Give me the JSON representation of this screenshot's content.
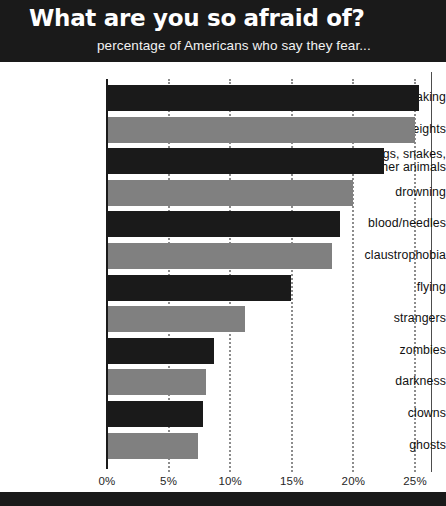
{
  "header": {
    "title": "What are you so afraid of?",
    "subtitle": "percentage of Americans who say they fear..."
  },
  "colors": {
    "band_background": "#1a1a1a",
    "bar_dark": "#1a1a1a",
    "bar_light": "#808080",
    "gridline": "#8c8c8c",
    "page_background": "#ffffff"
  },
  "chart_data": {
    "type": "bar",
    "orientation": "horizontal",
    "title": "What are you so afraid of?",
    "subtitle": "percentage of Americans who say they fear...",
    "xlabel": "",
    "ylabel": "",
    "xlim": [
      0,
      26
    ],
    "xticks": [
      0,
      5,
      10,
      15,
      20,
      25
    ],
    "xtick_labels": [
      "0%",
      "5%",
      "10%",
      "15%",
      "20%",
      "25%"
    ],
    "grid": true,
    "legend": false,
    "value_suffix": "%",
    "categories": [
      "public speaking",
      "heights",
      "bugs, snakes, or other animals",
      "drowning",
      "blood/needles",
      "claustrophobia",
      "flying",
      "strangers",
      "zombies",
      "darkness",
      "clowns",
      "ghosts"
    ],
    "values": [
      25.3,
      25.0,
      22.5,
      20.0,
      18.9,
      18.3,
      14.9,
      11.2,
      8.7,
      8.0,
      7.8,
      7.4
    ],
    "bar_colors": [
      "#1a1a1a",
      "#808080",
      "#1a1a1a",
      "#808080",
      "#1a1a1a",
      "#808080",
      "#1a1a1a",
      "#808080",
      "#1a1a1a",
      "#808080",
      "#1a1a1a",
      "#808080"
    ],
    "rows": [
      {
        "label_line1": "public speaking",
        "label_line2": "",
        "value": 25.3,
        "shade": "dark"
      },
      {
        "label_line1": "heights",
        "label_line2": "",
        "value": 25.0,
        "shade": "light"
      },
      {
        "label_line1": "bugs, snakes,",
        "label_line2": "or other animals",
        "value": 22.5,
        "shade": "dark"
      },
      {
        "label_line1": "drowning",
        "label_line2": "",
        "value": 20.0,
        "shade": "light"
      },
      {
        "label_line1": "blood/needles",
        "label_line2": "",
        "value": 18.9,
        "shade": "dark"
      },
      {
        "label_line1": "claustrophobia",
        "label_line2": "",
        "value": 18.3,
        "shade": "light"
      },
      {
        "label_line1": "flying",
        "label_line2": "",
        "value": 14.9,
        "shade": "dark"
      },
      {
        "label_line1": "strangers",
        "label_line2": "",
        "value": 11.2,
        "shade": "light"
      },
      {
        "label_line1": "zombies",
        "label_line2": "",
        "value": 8.7,
        "shade": "dark"
      },
      {
        "label_line1": "darkness",
        "label_line2": "",
        "value": 8.0,
        "shade": "light"
      },
      {
        "label_line1": "clowns",
        "label_line2": "",
        "value": 7.8,
        "shade": "dark"
      },
      {
        "label_line1": "ghosts",
        "label_line2": "",
        "value": 7.4,
        "shade": "light"
      }
    ]
  }
}
